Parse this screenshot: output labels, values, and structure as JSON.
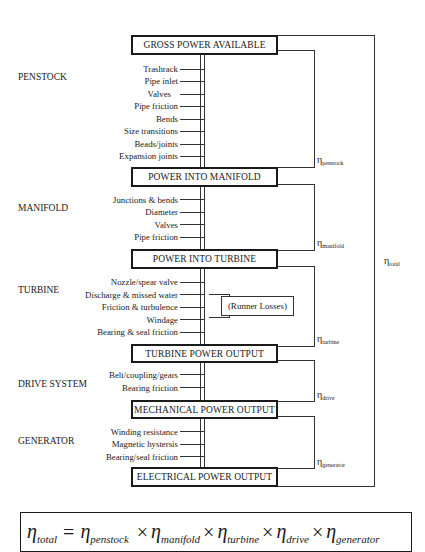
{
  "stages": [
    {
      "header": "GROSS POWER AVAILABLE"
    },
    {
      "header": "POWER INTO MANIFOLD"
    },
    {
      "header": "POWER INTO TURBINE"
    },
    {
      "header": "TURBINE POWER OUTPUT"
    },
    {
      "header": "MECHANICAL POWER OUTPUT"
    },
    {
      "header": "ELECTRICAL POWER OUTPUT"
    }
  ],
  "sections": [
    {
      "name": "PENSTOCK",
      "eta_sub": "penstock",
      "items": [
        "Trashrack",
        "Pipe inlet",
        "Valves",
        "Pipe friction",
        "Bends",
        "Size transitions",
        "Beads/joints",
        "Expansion joints"
      ]
    },
    {
      "name": "MANIFOLD",
      "eta_sub": "manifold",
      "items": [
        "Junctions & bends",
        "Diameter",
        "Valves",
        "Pipe friction"
      ]
    },
    {
      "name": "TURBINE",
      "eta_sub": "turbine",
      "items": [
        "Nozzle/spear valve",
        "Discharge & missed water",
        "Friction & turbulence",
        "Windage",
        "Bearing & seal friction"
      ]
    },
    {
      "name": "DRIVE SYSTEM",
      "eta_sub": "drive",
      "items": [
        "Belt/coupling/gears",
        "Bearing friction"
      ]
    },
    {
      "name": "GENERATOR",
      "eta_sub": "generator",
      "items": [
        "Winding resistance",
        "Magnetic hystersis",
        "Bearing/seal friction"
      ]
    }
  ],
  "runner_losses": "(Runner Losses)",
  "eta_symbol": "η",
  "eta_total_sub": "total",
  "formula": {
    "lhs": "η",
    "lhs_sub": "total",
    "equals": "=",
    "times": "×",
    "terms": [
      {
        "sym": "η",
        "sub": "penstock"
      },
      {
        "sym": "η",
        "sub": "manifold"
      },
      {
        "sym": "η",
        "sub": "turbine"
      },
      {
        "sym": "η",
        "sub": "drive"
      },
      {
        "sym": "η",
        "sub": "generator"
      }
    ]
  }
}
